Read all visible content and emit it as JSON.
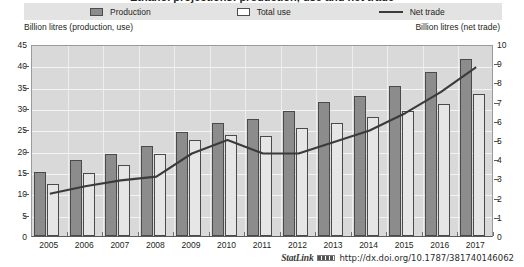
{
  "figure": {
    "title": "Ethanol projections: production, use and net trade",
    "legend": [
      {
        "label": "Production",
        "icon": "filled-square-swatch",
        "color": "#8c8c8c"
      },
      {
        "label": "Total use",
        "icon": "open-square-swatch",
        "color": "#ffffff"
      },
      {
        "label": "Net trade",
        "icon": "line-swatch",
        "color": "#3b3b3b"
      }
    ],
    "left_unit_caption": "Billion litres (production, use)",
    "right_unit_caption": "Billion litres (net trade)",
    "statlink": {
      "word": "StatLink",
      "glyph": "barcode-icon",
      "url": "http://dx.doi.org/10.1787/381740146062"
    }
  },
  "chart_data": {
    "type": "bar",
    "title": "Ethanol projections: production, use and net trade",
    "subtitle": "",
    "xlabel": "",
    "ylabel": "Billion litres (production, use)",
    "y2label": "Billion litres (net trade)",
    "grid": true,
    "legend_position": "top",
    "categories": [
      "2005",
      "2006",
      "2007",
      "2008",
      "2009",
      "2010",
      "2011",
      "2012",
      "2013",
      "2014",
      "2015",
      "2016",
      "2017"
    ],
    "ylim": [
      0,
      45
    ],
    "yticks": [
      0,
      5,
      10,
      15,
      20,
      25,
      30,
      35,
      40,
      45
    ],
    "y2lim": [
      0,
      10
    ],
    "y2ticks": [
      0,
      1,
      2,
      3,
      4,
      5,
      6,
      7,
      8,
      9,
      10
    ],
    "series": [
      {
        "name": "Production",
        "axis": "left",
        "type": "bar",
        "color": "#8c8c8c",
        "values": [
          15.1,
          17.7,
          19.2,
          21.1,
          24.3,
          26.4,
          27.4,
          29.2,
          31.4,
          32.8,
          35.2,
          38.5,
          41.6
        ]
      },
      {
        "name": "Total use",
        "axis": "left",
        "type": "bar",
        "color": "#e6e6e6",
        "values": [
          12.1,
          14.8,
          16.6,
          19.3,
          22.4,
          23.6,
          23.5,
          25.2,
          26.4,
          27.8,
          29.2,
          31.0,
          33.4
        ]
      },
      {
        "name": "Net trade",
        "axis": "right",
        "type": "line",
        "color": "#3b3b3b",
        "values": [
          2.3,
          2.7,
          3.0,
          3.2,
          4.4,
          5.1,
          4.4,
          4.4,
          5.0,
          5.6,
          6.5,
          7.6,
          8.9
        ]
      }
    ]
  }
}
